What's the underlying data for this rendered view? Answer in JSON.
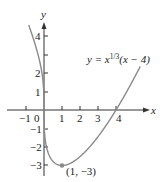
{
  "chart_data": {
    "type": "line",
    "title": "",
    "xlabel": "x",
    "ylabel": "y",
    "function": "y = x^(1/3)(x - 4)",
    "equation_label": {
      "prefix": "y = x",
      "exponent": "1/3",
      "suffix": "(x − 4)"
    },
    "xlim": [
      -2,
      6
    ],
    "ylim": [
      -3.5,
      5
    ],
    "x_ticks": [
      -1,
      1,
      2,
      3,
      4
    ],
    "x_tick_labels": [
      "−1",
      "0",
      "1",
      "2",
      "3",
      "4"
    ],
    "y_ticks": [
      -3,
      -2,
      -1,
      1,
      2,
      3,
      4
    ],
    "y_tick_labels": [
      "4",
      "2",
      "1",
      "−1",
      "−2",
      "−3"
    ],
    "grid": false,
    "series": [
      {
        "name": "y = x^(1/3)(x - 4)",
        "x": [
          -0.85,
          -0.5,
          0,
          0.5,
          1,
          2,
          3,
          4,
          5,
          5.35
        ],
        "y": [
          4.2,
          3.57,
          0,
          -2.78,
          -3,
          -2.52,
          -1.44,
          0,
          1.71,
          2.33
        ],
        "color": "#888888"
      }
    ],
    "annotations": [
      {
        "type": "point",
        "x": 1,
        "y": -3,
        "label": "(1, −3)"
      }
    ]
  },
  "labels": {
    "x_axis": "x",
    "y_axis": "y",
    "origin": "0",
    "point": "(1, −3)",
    "eq_prefix": "y = x",
    "eq_exp": "1/3",
    "eq_suffix": "(x − 4)",
    "xt_m1": "−1",
    "xt_1": "1",
    "xt_2": "2",
    "xt_3": "3",
    "xt_4": "4",
    "yt_4": "4",
    "yt_2": "2",
    "yt_1": "1",
    "yt_m1": "−1",
    "yt_m2": "−2",
    "yt_m3": "−3"
  }
}
